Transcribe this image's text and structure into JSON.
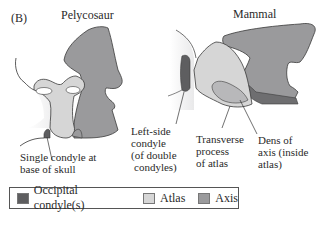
{
  "figure": {
    "panel_label": "(B)",
    "left_title": "Pelycosaur",
    "right_title": "Mammal"
  },
  "annotations": {
    "single_condyle": [
      "Single condyle at",
      "base of skull"
    ],
    "left_side_condyle": [
      "Left-side",
      "condyle",
      "(of double",
      "condyles)"
    ],
    "transverse_process": [
      "Transverse",
      "process",
      "of atlas"
    ],
    "dens": [
      "Dens of",
      "axis (inside",
      "atlas)"
    ]
  },
  "legend": {
    "items": [
      {
        "label": "Occipital condyle(s)",
        "color": "#5e5e60"
      },
      {
        "label": "Atlas",
        "color": "#d6d6d6"
      },
      {
        "label": "Axis",
        "color": "#9a9a9c"
      }
    ]
  },
  "colors": {
    "occipital": "#5e5e60",
    "atlas": "#d6d6d6",
    "axis": "#9a9a9c",
    "outline": "#3a3a3a"
  }
}
